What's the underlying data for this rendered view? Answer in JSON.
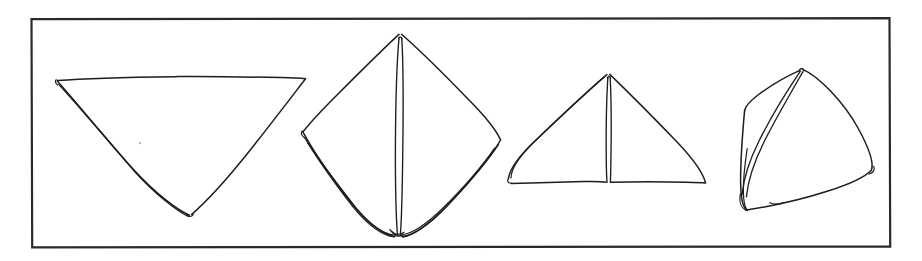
{
  "page": {
    "width": 922,
    "height": 261,
    "background_color": "#ffffff",
    "ink_color": "#1d1d1f",
    "frame_color": "#2a2a2c"
  },
  "frame": {
    "name": "illustration-border",
    "x": 31,
    "y": 18,
    "width": 859,
    "height": 229,
    "stroke_width": 2.2
  },
  "figures": [
    {
      "index": 1,
      "label": "Step 1",
      "shape": "inverted-triangle",
      "description": "Square cloth folded once into a downward pointing triangle with doubled left edge",
      "vertices": [
        [
          57,
          80
        ],
        [
          305,
          79
        ],
        [
          190,
          215
        ]
      ],
      "fold_count": 1,
      "bbox": [
        55,
        76,
        252,
        142
      ]
    },
    {
      "index": 2,
      "label": "Step 2",
      "shape": "diamond",
      "description": "Diamond or kite orientation with a vertical center fold and layered lower edges",
      "vertices": [
        [
          400,
          34
        ],
        [
          500,
          140
        ],
        [
          400,
          235
        ],
        [
          303,
          132
        ]
      ],
      "fold_count": 3,
      "bbox": [
        300,
        32,
        203,
        205
      ]
    },
    {
      "index": 3,
      "label": "Step 3",
      "shape": "upright-triangle",
      "description": "Upward pointing triangle with a vertical center seam splitting the base",
      "vertices": [
        [
          608,
          74
        ],
        [
          705,
          183
        ],
        [
          509,
          183
        ]
      ],
      "fold_count": 2,
      "bbox": [
        505,
        70,
        202,
        116
      ]
    },
    {
      "index": 4,
      "label": "Step 4",
      "shape": "tilted-triangle",
      "description": "Finished triangle tipped to the right with a long diagonal fold running to the lower left corner",
      "vertices": [
        [
          800,
          70
        ],
        [
          871,
          170
        ],
        [
          744,
          209
        ],
        [
          749,
          110
        ]
      ],
      "fold_count": 2,
      "bbox": [
        740,
        66,
        135,
        148
      ]
    }
  ],
  "annotations": {
    "speck": {
      "name": "paper-speck",
      "x": 140,
      "y": 143
    }
  }
}
